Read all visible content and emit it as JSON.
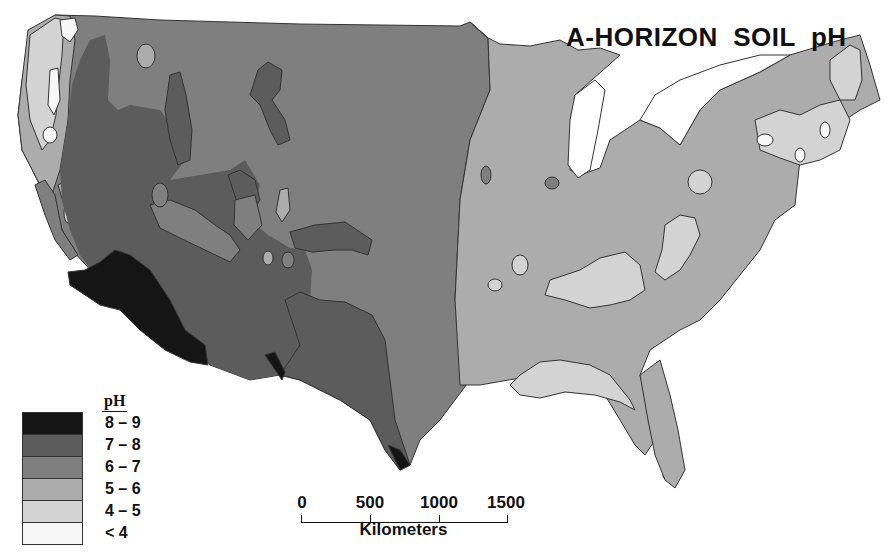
{
  "title": "A-HORIZON  SOIL  pH",
  "legend": {
    "title": "pH",
    "classes": [
      {
        "label": "8 – 9",
        "color": "#151515"
      },
      {
        "label": "7 – 8",
        "color": "#5c5c5c"
      },
      {
        "label": "6 – 7",
        "color": "#7f7f7f"
      },
      {
        "label": "5 – 6",
        "color": "#acacac"
      },
      {
        "label": "4 – 5",
        "color": "#d3d3d3"
      },
      {
        "label": "< 4",
        "color": "#f7f7f7"
      }
    ]
  },
  "scale_bar": {
    "ticks": [
      "0",
      "500",
      "1000",
      "1500"
    ],
    "unit": "Kilometers"
  },
  "map": {
    "region": "Conterminous United States",
    "background": "#ffffff",
    "border_color": "#333333"
  }
}
